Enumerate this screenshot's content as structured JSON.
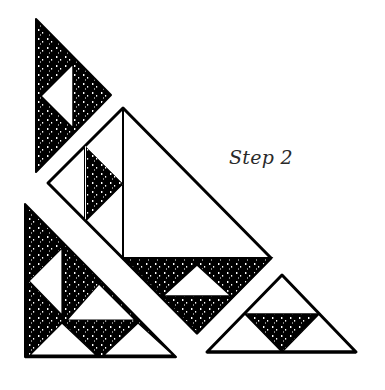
{
  "figure": {
    "caption": "Step 2",
    "colors": {
      "ink": "#000000",
      "paper": "#ffffff",
      "speckle": "#ffffff"
    },
    "pieces": [
      {
        "id": "top-left-triangle",
        "description": "dark triangle with white inner triangle"
      },
      {
        "id": "middle-large-triangle",
        "description": "outlined triangle split by vertical line with dark sub-triangles"
      },
      {
        "id": "bottom-left-triangle",
        "description": "right triangle with alternating dark and white sub-triangles"
      },
      {
        "id": "bottom-right-triangle",
        "description": "outlined triangle with inverted dark center triangle"
      }
    ]
  }
}
